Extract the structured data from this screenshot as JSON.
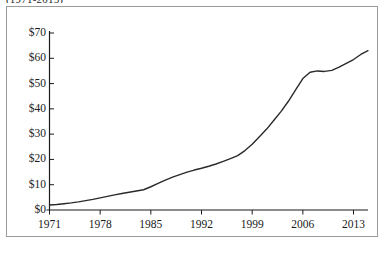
{
  "figure": {
    "top_caption": "(1971-2015)",
    "background_color": "#ffffff",
    "frame_color": "#9a9a9a",
    "line_color": "#2a2a2a",
    "axis_color": "#1a1a1a",
    "bottom_artifact": ""
  },
  "chart_data": {
    "type": "line",
    "title": "(1971-2015)",
    "xlabel": "",
    "ylabel": "",
    "xlim": [
      1971,
      2015
    ],
    "ylim": [
      0,
      70
    ],
    "grid": false,
    "legend": null,
    "y_tick_labels": [
      "$70",
      "$60",
      "$50",
      "$40",
      "$30",
      "$20",
      "$10",
      "$0"
    ],
    "y_tick_values": [
      70,
      60,
      50,
      40,
      30,
      20,
      10,
      0
    ],
    "x_tick_labels": [
      "1971",
      "1978",
      "1985",
      "1992",
      "1999",
      "2006",
      "2013"
    ],
    "x_tick_values": [
      1971,
      1978,
      1985,
      1992,
      1999,
      2006,
      2013
    ],
    "series": [
      {
        "name": "value",
        "x": [
          1971,
          1972,
          1973,
          1974,
          1975,
          1976,
          1977,
          1978,
          1979,
          1980,
          1981,
          1982,
          1983,
          1984,
          1985,
          1986,
          1987,
          1988,
          1989,
          1990,
          1991,
          1992,
          1993,
          1994,
          1995,
          1996,
          1997,
          1998,
          1999,
          2000,
          2001,
          2002,
          2003,
          2004,
          2005,
          2006,
          2007,
          2008,
          2009,
          2010,
          2011,
          2012,
          2013,
          2014,
          2015
        ],
        "values": [
          2.0,
          2.2,
          2.5,
          2.8,
          3.2,
          3.7,
          4.2,
          4.8,
          5.4,
          6.0,
          6.5,
          7.0,
          7.5,
          8.0,
          9.2,
          10.5,
          11.8,
          13.0,
          14.0,
          15.0,
          15.8,
          16.5,
          17.3,
          18.2,
          19.2,
          20.3,
          21.5,
          23.5,
          26.0,
          29.0,
          32.0,
          35.5,
          39.0,
          43.0,
          47.5,
          52.0,
          54.5,
          55.0,
          54.8,
          55.2,
          56.5,
          58.0,
          59.5,
          61.5,
          63.0
        ]
      }
    ]
  }
}
